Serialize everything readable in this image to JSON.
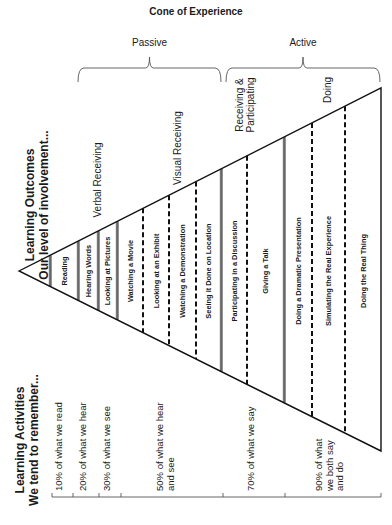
{
  "title": "Cone of Experience",
  "brackets": [
    {
      "label": "Passive",
      "x1": 78,
      "x2": 221
    },
    {
      "label": "Active",
      "x1": 226,
      "x2": 380
    }
  ],
  "side_titles": {
    "outcomes_line1": "Learning Outcomes",
    "outcomes_line2": "Our level of involvement...",
    "activities_line1": "Learning Activities",
    "activities_line2": "We tend to remember..."
  },
  "sections": [
    {
      "label": "Verbal Receiving",
      "lines": [
        "Verbal Receiving"
      ],
      "x": 98,
      "y": 180
    },
    {
      "label": "Visual Receiving",
      "lines": [
        "Visual Receiving"
      ],
      "x": 178,
      "y": 148
    },
    {
      "label": "Receiving & Participating",
      "lines": [
        "Receiving &",
        "Participating"
      ],
      "x": 245,
      "y": 105
    },
    {
      "label": "Doing",
      "lines": [
        "Doing"
      ],
      "x": 328,
      "y": 90
    }
  ],
  "cone": {
    "apex": [
      19,
      271
    ],
    "top_right": [
      381,
      88
    ],
    "bottom_right": [
      381,
      451
    ]
  },
  "dividers": [
    {
      "x": 50,
      "style": "solid"
    },
    {
      "x": 78,
      "style": "solid"
    },
    {
      "x": 98,
      "style": "solid"
    },
    {
      "x": 117,
      "style": "solid"
    },
    {
      "x": 143,
      "style": "dashed"
    },
    {
      "x": 169,
      "style": "dashed"
    },
    {
      "x": 196,
      "style": "dashed"
    },
    {
      "x": 221,
      "style": "solid"
    },
    {
      "x": 247,
      "style": "dashed"
    },
    {
      "x": 284,
      "style": "solid"
    },
    {
      "x": 312,
      "style": "dashed"
    },
    {
      "x": 345,
      "style": "dashed"
    }
  ],
  "activities": [
    {
      "label": "Reading",
      "x": 64
    },
    {
      "label": "Hearing Words",
      "x": 88
    },
    {
      "label": "Looking at Pictures",
      "x": 107.5
    },
    {
      "label": "Watching a Movie",
      "x": 130
    },
    {
      "label": "Looking at an Exhibit",
      "x": 156
    },
    {
      "label": "Watching a Demonstration",
      "x": 182.5
    },
    {
      "label": "Seeing it Done on Location",
      "x": 208.5
    },
    {
      "label": "Participating in a Discussion",
      "x": 234
    },
    {
      "label": "Giving a Talk",
      "x": 265.5
    },
    {
      "label": "Doing a Dramatic Presentation",
      "x": 298
    },
    {
      "label": "Simulating the Real Experience",
      "x": 328.5
    },
    {
      "label": "Doing the Real Thing",
      "x": 363
    }
  ],
  "retention": {
    "axis_y": 497,
    "ticks": [
      52,
      73,
      99,
      121,
      223,
      285,
      381
    ],
    "labels": [
      {
        "lines": [
          "10% of what we read"
        ],
        "x": 62
      },
      {
        "lines": [
          "20% of what we hear"
        ],
        "x": 86
      },
      {
        "lines": [
          "30% of what we see"
        ],
        "x": 110
      },
      {
        "lines": [
          "50% of what we hear",
          "and see"
        ],
        "x": 163
      },
      {
        "lines": [
          "70% of what we say"
        ],
        "x": 254
      },
      {
        "lines": [
          "90% of what",
          "we both say",
          "and do"
        ],
        "x": 322
      }
    ]
  }
}
